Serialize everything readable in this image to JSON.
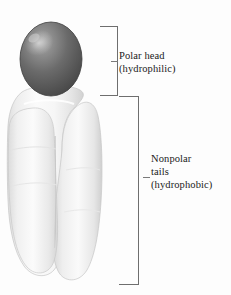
{
  "figure": {
    "background_color": "#fdfdfd",
    "line_color": "#6e6e6e",
    "text_color": "#1a1a1a"
  },
  "labels": {
    "polar": {
      "line1": "Polar head",
      "line2": "(hydrophilic)"
    },
    "nonpolar": {
      "line1": "Nonpolar",
      "line2": "tails",
      "line3": "(hydrophobic)"
    }
  },
  "molecule": {
    "head": {
      "name": "polar head sphere",
      "color_dark": "#4d4d4d",
      "color_mid": "#6f6f6f",
      "color_highlight": "#b9b9b9"
    },
    "tails": {
      "name": "two nonpolar fatty acid tails",
      "color_light": "#f2f2f2",
      "color_shadow": "#c9c9c9"
    }
  },
  "brackets": {
    "polar_head": {
      "name": "polar head bracket"
    },
    "nonpolar_tails": {
      "name": "nonpolar tails bracket"
    }
  }
}
